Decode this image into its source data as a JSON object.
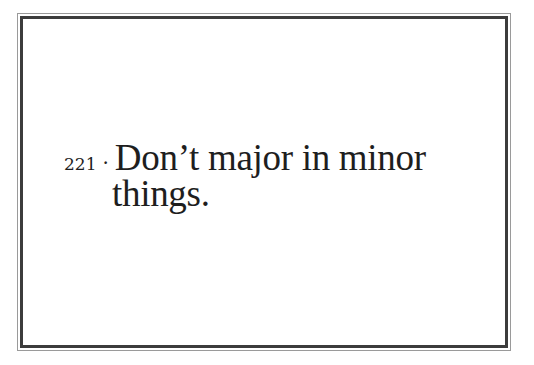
{
  "page": {
    "number": "221",
    "separator": "·",
    "quote_line1": "Don’t major in minor",
    "quote_line2": "things."
  },
  "colors": {
    "text": "#1e1e1e",
    "frame_inner": "#3c3c3c",
    "frame_outer": "#9a9a9a",
    "background": "#ffffff"
  }
}
